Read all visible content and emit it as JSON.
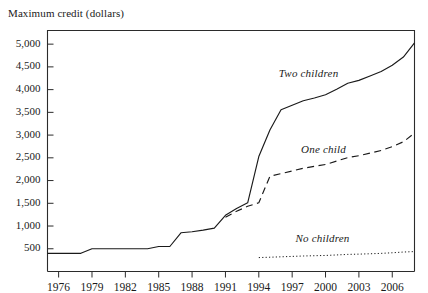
{
  "figure": {
    "ylabel": "Maximum credit (dollars)",
    "xlabel": ""
  },
  "chart_data": {
    "type": "line",
    "title": "",
    "subtitle": "",
    "xlabel": "",
    "ylabel": "Maximum credit (dollars)",
    "xlim": [
      1975,
      2008
    ],
    "ylim": [
      0,
      5300
    ],
    "grid": false,
    "legend_position": "inline-annotations",
    "x_ticks": [
      1976,
      1979,
      1982,
      1985,
      1988,
      1991,
      1994,
      1997,
      2000,
      2003,
      2006
    ],
    "x_tick_labels": [
      "1976",
      "1979",
      "1982",
      "1985",
      "1988",
      "1991",
      "1994",
      "1997",
      "2000",
      "2003",
      "2006"
    ],
    "y_ticks": [
      500,
      1000,
      1500,
      2000,
      2500,
      3000,
      3500,
      4000,
      4500,
      5000
    ],
    "y_tick_labels": [
      "500",
      "1,000",
      "1,500",
      "2,000",
      "2,500",
      "3,000",
      "3,500",
      "4,000",
      "4,500",
      "5,000"
    ],
    "x": [
      1975,
      1976,
      1977,
      1978,
      1979,
      1980,
      1981,
      1982,
      1983,
      1984,
      1985,
      1986,
      1987,
      1988,
      1989,
      1990,
      1991,
      1992,
      1993,
      1994,
      1995,
      1996,
      1997,
      1998,
      1999,
      2000,
      2001,
      2002,
      2003,
      2004,
      2005,
      2006,
      2007,
      2008
    ],
    "series": [
      {
        "name": "Two children",
        "label": "Two children",
        "style": "solid",
        "color": "#1a1a1a",
        "values": [
          400,
          400,
          400,
          400,
          500,
          500,
          500,
          500,
          500,
          500,
          550,
          550,
          851,
          874,
          910,
          953,
          1235,
          1384,
          1511,
          2528,
          3110,
          3556,
          3656,
          3756,
          3816,
          3888,
          4008,
          4140,
          4204,
          4300,
          4400,
          4536,
          4716,
          5028
        ]
      },
      {
        "name": "One child",
        "label": "One child",
        "style": "dashed",
        "color": "#1a1a1a",
        "values": [
          null,
          null,
          null,
          null,
          null,
          null,
          null,
          null,
          null,
          null,
          null,
          null,
          null,
          null,
          null,
          null,
          1192,
          1324,
          1434,
          1511,
          2094,
          2152,
          2210,
          2271,
          2312,
          2353,
          2428,
          2506,
          2547,
          2604,
          2662,
          2747,
          2853,
          3043
        ]
      },
      {
        "name": "No children",
        "label": "No children",
        "style": "dotted",
        "color": "#1a1a1a",
        "values": [
          null,
          null,
          null,
          null,
          null,
          null,
          null,
          null,
          null,
          null,
          null,
          null,
          null,
          null,
          null,
          null,
          null,
          null,
          null,
          306,
          314,
          323,
          332,
          341,
          347,
          353,
          364,
          376,
          382,
          390,
          399,
          412,
          428,
          438
        ]
      }
    ],
    "annotations": [
      {
        "text": "Two children",
        "x": 1998.5,
        "y": 4320
      },
      {
        "text": "One child",
        "x": 2000.5,
        "y": 2660
      },
      {
        "text": "No children",
        "x": 2000.0,
        "y": 700
      }
    ]
  }
}
